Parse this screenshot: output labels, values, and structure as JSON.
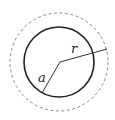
{
  "diagram": {
    "title": "",
    "outer_circle": {
      "style": "dashed",
      "color": "#888888",
      "cx": 59,
      "cy": 62,
      "r": 49
    },
    "inner_circle": {
      "style": "solid",
      "color": "#222222",
      "cx": 59,
      "cy": 62,
      "r": 35
    },
    "center": {
      "x": 60,
      "y": 62
    },
    "radius_lines": [
      {
        "name": "r",
        "label": "r",
        "to": {
          "x": 107,
          "y": 49
        },
        "label_pos": {
          "x": 71,
          "y": 53
        }
      },
      {
        "name": "a",
        "label": "a",
        "to": {
          "x": 42,
          "y": 93
        },
        "label_pos": {
          "x": 38,
          "y": 82
        }
      }
    ],
    "labels": {
      "r": "r",
      "a": "a"
    }
  }
}
